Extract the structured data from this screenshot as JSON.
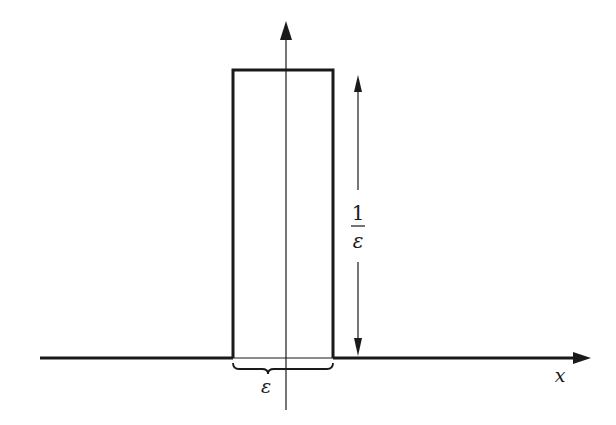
{
  "figure": {
    "type": "diagram",
    "labels": {
      "x_axis": "x",
      "width": "ε",
      "height_numerator": "1",
      "height_denominator": "ε"
    },
    "colors": {
      "stroke": "#1a1a1a",
      "background": "#ffffff"
    }
  }
}
